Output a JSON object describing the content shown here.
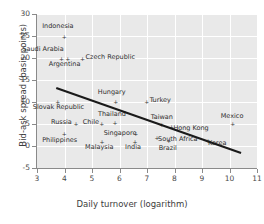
{
  "chart_data": {
    "type": "scatter",
    "title": "",
    "xlabel": "Daily turnover (logarithm)",
    "ylabel": "Bid-ask spread (basis points)",
    "xlim": [
      3,
      11
    ],
    "ylim": [
      -5,
      30
    ],
    "xticks": [
      3,
      4,
      5,
      6,
      7,
      8,
      9,
      10,
      11
    ],
    "yticks": [
      -5,
      0,
      5,
      10,
      15,
      20,
      25,
      30
    ],
    "grid": true,
    "legend": "none",
    "marker": "plus",
    "points": [
      {
        "label": "Indonesia",
        "x": 3.95,
        "y": 24.7,
        "lx": -21,
        "ly": -11
      },
      {
        "label": "Saudi Arabia",
        "x": 3.85,
        "y": 19.7,
        "lx": -38,
        "ly": -10
      },
      {
        "label": "Argentina",
        "x": 4.08,
        "y": 19.7,
        "lx": -18,
        "ly": 5
      },
      {
        "label": "Czech Republic",
        "x": 4.62,
        "y": 19.6,
        "lx": 4,
        "ly": -3
      },
      {
        "label": "Hungary",
        "x": 5.83,
        "y": 9.9,
        "lx": -17,
        "ly": -10
      },
      {
        "label": "Turkey",
        "x": 6.95,
        "y": 9.8,
        "lx": 4,
        "ly": -3
      },
      {
        "label": "Slovak Republic",
        "x": 3.72,
        "y": 9.8,
        "lx": -24,
        "ly": 4
      },
      {
        "label": "Thailand",
        "x": 5.8,
        "y": 5.2,
        "lx": -16,
        "ly": -9
      },
      {
        "label": "Taiwan",
        "x": 7.5,
        "y": 4.6,
        "lx": -10,
        "ly": -9
      },
      {
        "label": "Hong Kong",
        "x": 7.85,
        "y": 4.3,
        "lx": 3,
        "ly": 1
      },
      {
        "label": "Mexico",
        "x": 10.08,
        "y": 4.8,
        "lx": -11,
        "ly": -9
      },
      {
        "label": "Russia",
        "x": 4.38,
        "y": 5.0,
        "lx": -24,
        "ly": -2
      },
      {
        "label": "Chile",
        "x": 5.32,
        "y": 5.0,
        "lx": -18,
        "ly": -2
      },
      {
        "label": "Singapore",
        "x": 6.55,
        "y": 2.6,
        "lx": -31,
        "ly": -2
      },
      {
        "label": "Philippines",
        "x": 3.95,
        "y": 2.6,
        "lx": -21,
        "ly": 5
      },
      {
        "label": "Malaysia",
        "x": 5.33,
        "y": 0.9,
        "lx": -16,
        "ly": 5
      },
      {
        "label": "India",
        "x": 6.53,
        "y": 0.9,
        "lx": -9,
        "ly": 5
      },
      {
        "label": "South Africa",
        "x": 7.33,
        "y": 1.7,
        "lx": 2,
        "ly": 0
      },
      {
        "label": "Brazil",
        "x": 7.75,
        "y": 1.0,
        "lx": -9,
        "ly": 6
      },
      {
        "label": "Korea",
        "x": 9.18,
        "y": 1.0,
        "lx": 1,
        "ly": 1
      }
    ],
    "trendline": {
      "x_start": 3.7,
      "y_start": 13.2,
      "x_end": 10.42,
      "y_end": -1.6
    }
  }
}
